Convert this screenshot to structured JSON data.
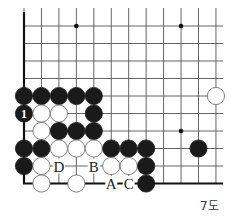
{
  "diagram": {
    "type": "go-board-fragment",
    "caption": "7도",
    "columns": 12,
    "rows": 10,
    "colors": {
      "black": "#1a1a1a",
      "white": "#ffffff",
      "line": "#555555",
      "edge": "#111111"
    },
    "star_points": [
      [
        3,
        0
      ],
      [
        9,
        0
      ],
      [
        9,
        6
      ]
    ],
    "stones": [
      {
        "col": 0,
        "row": 4,
        "color": "black"
      },
      {
        "col": 1,
        "row": 4,
        "color": "black"
      },
      {
        "col": 2,
        "row": 4,
        "color": "black"
      },
      {
        "col": 3,
        "row": 4,
        "color": "black"
      },
      {
        "col": 4,
        "row": 4,
        "color": "black"
      },
      {
        "col": 11,
        "row": 4,
        "color": "white"
      },
      {
        "col": 0,
        "row": 5,
        "color": "black",
        "mark": "1"
      },
      {
        "col": 1,
        "row": 5,
        "color": "white"
      },
      {
        "col": 2,
        "row": 5,
        "color": "white"
      },
      {
        "col": 4,
        "row": 5,
        "color": "black"
      },
      {
        "col": 1,
        "row": 6,
        "color": "white"
      },
      {
        "col": 2,
        "row": 6,
        "color": "black"
      },
      {
        "col": 3,
        "row": 6,
        "color": "black"
      },
      {
        "col": 4,
        "row": 6,
        "color": "black"
      },
      {
        "col": 0,
        "row": 7,
        "color": "black"
      },
      {
        "col": 1,
        "row": 7,
        "color": "black"
      },
      {
        "col": 2,
        "row": 7,
        "color": "white"
      },
      {
        "col": 3,
        "row": 7,
        "color": "white"
      },
      {
        "col": 4,
        "row": 7,
        "color": "white"
      },
      {
        "col": 5,
        "row": 7,
        "color": "black"
      },
      {
        "col": 6,
        "row": 7,
        "color": "black"
      },
      {
        "col": 7,
        "row": 7,
        "color": "black"
      },
      {
        "col": 10,
        "row": 7,
        "color": "black"
      },
      {
        "col": 0,
        "row": 8,
        "color": "black"
      },
      {
        "col": 1,
        "row": 8,
        "color": "white"
      },
      {
        "col": 5,
        "row": 8,
        "color": "white"
      },
      {
        "col": 6,
        "row": 8,
        "color": "white"
      },
      {
        "col": 7,
        "row": 8,
        "color": "black"
      },
      {
        "col": 1,
        "row": 9,
        "color": "white"
      },
      {
        "col": 3,
        "row": 9,
        "color": "white"
      },
      {
        "col": 7,
        "row": 9,
        "color": "black"
      }
    ],
    "labels": [
      {
        "col": 2,
        "row": 8,
        "text": "D"
      },
      {
        "col": 4,
        "row": 8,
        "text": "B"
      },
      {
        "col": 5,
        "row": 9,
        "text": "A"
      },
      {
        "col": 6,
        "row": 9,
        "text": "C"
      }
    ]
  }
}
